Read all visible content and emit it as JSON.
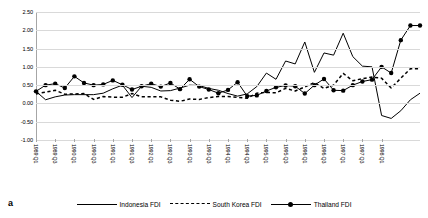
{
  "figure": {
    "label": "a"
  },
  "legend": {
    "position": "bottom-center",
    "items": [
      {
        "name": "Indonesia FDI",
        "style": "solid",
        "marker": "none",
        "color": "#000000"
      },
      {
        "name": "South Korea FDI",
        "style": "dashed",
        "marker": "none",
        "color": "#000000"
      },
      {
        "name": "Thailand FDI",
        "style": "solid-marker",
        "marker": "circle",
        "color": "#000000"
      }
    ]
  },
  "chart_data": {
    "type": "line",
    "title": "",
    "subtitle": "",
    "xlabel": "",
    "ylabel": "",
    "ylim": [
      -1.0,
      2.5
    ],
    "yticks": [
      2.5,
      2.0,
      1.5,
      1.0,
      0.5,
      0.0,
      -0.5,
      -1.0
    ],
    "ytick_labels": [
      "2.50",
      "2.00",
      "1.50",
      "1.00",
      "0.50",
      "0.00",
      "-0.50",
      "-1.00"
    ],
    "grid": true,
    "grid_axis": "y",
    "x": [
      "1989 Q1",
      "1989 Q2",
      "1989 Q3",
      "1989 Q4",
      "1990 Q1",
      "1990 Q2",
      "1990 Q3",
      "1990 Q4",
      "1991 Q1",
      "1991 Q2",
      "1991 Q3",
      "1991 Q4",
      "1992 Q1",
      "1992 Q2",
      "1992 Q3",
      "1992 Q4",
      "1993 Q1",
      "1993 Q2",
      "1993 Q3",
      "1993 Q4",
      "1994 Q1",
      "1994 Q2",
      "1994 Q3",
      "1994 Q4",
      "1995 Q1",
      "1995 Q2",
      "1995 Q3",
      "1995 Q4",
      "1996 Q1",
      "1996 Q2",
      "1996 Q3",
      "1996 Q4",
      "1997 Q1",
      "1997 Q2",
      "1997 Q3",
      "1997 Q4",
      "1998 Q1",
      "1998 Q2",
      "1998 Q3",
      "1998 Q4",
      "1999 Q1"
    ],
    "xtick_labels": [
      "1989 Q1",
      "1989 Q3",
      "1990 Q1",
      "1990 Q3",
      "1991 Q1",
      "1991 Q3",
      "1992 Q1",
      "1992 Q3",
      "1993 Q1",
      "1993 Q3",
      "1994 Q1",
      "1994 Q3",
      "1995 Q1",
      "1995 Q3",
      "1996 Q1",
      "1996 Q3",
      "1997 Q1",
      "1997 Q3",
      "1998 Q1"
    ],
    "xtick_every": 2,
    "series": [
      {
        "name": "Indonesia FDI",
        "style": "solid",
        "values": [
          0.33,
          0.1,
          0.18,
          0.23,
          0.24,
          0.24,
          0.24,
          0.28,
          0.4,
          0.5,
          0.16,
          0.47,
          0.44,
          0.34,
          0.35,
          0.42,
          0.5,
          0.49,
          0.41,
          0.36,
          0.27,
          0.2,
          0.26,
          0.46,
          0.83,
          0.66,
          1.16,
          1.08,
          1.68,
          0.85,
          1.38,
          1.32,
          1.92,
          1.28,
          1.02,
          1.0,
          -0.33,
          -0.41,
          -0.2,
          0.1,
          0.28
        ]
      },
      {
        "name": "South Korea FDI",
        "style": "dashed",
        "values": [
          0.26,
          0.31,
          0.36,
          0.25,
          0.26,
          0.27,
          0.11,
          0.19,
          0.17,
          0.17,
          0.27,
          0.18,
          0.18,
          0.18,
          0.09,
          0.06,
          0.12,
          0.11,
          0.16,
          0.19,
          0.19,
          0.17,
          0.14,
          0.28,
          0.3,
          0.29,
          0.41,
          0.34,
          0.45,
          0.57,
          0.41,
          0.5,
          0.82,
          0.62,
          0.68,
          0.72,
          0.69,
          0.42,
          0.69,
          0.95,
          0.95
        ]
      },
      {
        "name": "Thailand FDI",
        "style": "solid-marker",
        "marker": "circle",
        "values": [
          0.33,
          0.5,
          0.54,
          0.42,
          0.74,
          0.56,
          0.5,
          0.52,
          0.63,
          0.51,
          0.38,
          0.47,
          0.54,
          0.46,
          0.56,
          0.39,
          0.66,
          0.46,
          0.38,
          0.28,
          0.37,
          0.58,
          0.2,
          0.22,
          0.34,
          0.44,
          0.49,
          0.47,
          0.27,
          0.5,
          0.67,
          0.36,
          0.35,
          0.5,
          0.6,
          0.65,
          1.0,
          0.83,
          1.73,
          2.13,
          2.13
        ]
      }
    ],
    "annotations": []
  }
}
